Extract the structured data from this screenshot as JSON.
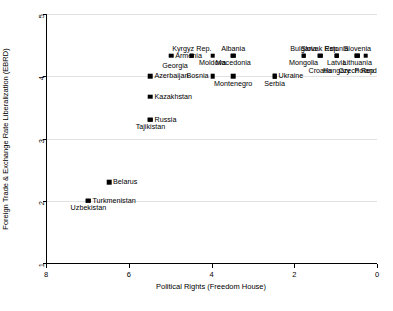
{
  "chart_data": {
    "type": "scatter",
    "title": "",
    "xlabel": "Political Rights (Freedom House)",
    "ylabel": "Foreign Trade & Exchange Rate Liberalization (EBRD)",
    "xlim": [
      8,
      0
    ],
    "ylim": [
      1,
      5
    ],
    "x_ticks": [
      8,
      6,
      4,
      2,
      0
    ],
    "y_ticks": [
      1,
      2,
      3,
      4,
      5
    ],
    "x_tick_labels": [
      "8",
      "6",
      "4",
      "2",
      "0"
    ],
    "y_tick_labels": [
      "1",
      "2",
      "3",
      "4",
      "5"
    ],
    "x_axis_reversed": true,
    "grid": "horizontal",
    "legend": "none",
    "marker": "filled-square",
    "marker_color": "#000000",
    "background_color": "#ffffff",
    "points": [
      {
        "label": "Armenia",
        "x": 5.0,
        "y": 4.33,
        "label_pos": "right"
      },
      {
        "label": "Kyrgyz Rep.",
        "x": 4.5,
        "y": 4.33,
        "label_pos": "above"
      },
      {
        "label": "Georgia",
        "x": 4.5,
        "y": 4.33,
        "label_pos": "below-left"
      },
      {
        "label": "Moldova",
        "x": 4.0,
        "y": 4.33,
        "label_pos": "below"
      },
      {
        "label": "Albania",
        "x": 3.5,
        "y": 4.33,
        "label_pos": "above"
      },
      {
        "label": "Macedonia",
        "x": 3.5,
        "y": 4.33,
        "label_pos": "below"
      },
      {
        "label": "Bulgaria",
        "x": 1.8,
        "y": 4.33,
        "label_pos": "above"
      },
      {
        "label": "Mongolia",
        "x": 1.8,
        "y": 4.33,
        "label_pos": "below"
      },
      {
        "label": "Slovak Rep.",
        "x": 1.4,
        "y": 4.33,
        "label_pos": "above"
      },
      {
        "label": "Croatia",
        "x": 1.4,
        "y": 4.33,
        "label_pos": "below2"
      },
      {
        "label": "Estonia",
        "x": 1.0,
        "y": 4.33,
        "label_pos": "above"
      },
      {
        "label": "Latvia",
        "x": 1.0,
        "y": 4.33,
        "label_pos": "below"
      },
      {
        "label": "Hungary",
        "x": 1.0,
        "y": 4.33,
        "label_pos": "below2"
      },
      {
        "label": "Slovenia",
        "x": 0.5,
        "y": 4.33,
        "label_pos": "above"
      },
      {
        "label": "Lithuania",
        "x": 0.5,
        "y": 4.33,
        "label_pos": "below"
      },
      {
        "label": "Czech Rep.",
        "x": 0.5,
        "y": 4.33,
        "label_pos": "below2"
      },
      {
        "label": "Poland",
        "x": 0.3,
        "y": 4.33,
        "label_pos": "below2"
      },
      {
        "label": "Azerbaijan",
        "x": 5.5,
        "y": 4.0,
        "label_pos": "right"
      },
      {
        "label": "Bosnia",
        "x": 4.0,
        "y": 4.0,
        "label_pos": "left"
      },
      {
        "label": "Montenegro",
        "x": 3.5,
        "y": 4.0,
        "label_pos": "below"
      },
      {
        "label": "Ukraine",
        "x": 2.5,
        "y": 4.0,
        "label_pos": "right"
      },
      {
        "label": "Serbia",
        "x": 2.5,
        "y": 4.0,
        "label_pos": "below"
      },
      {
        "label": "Kazakhstan",
        "x": 5.5,
        "y": 3.67,
        "label_pos": "right"
      },
      {
        "label": "Russia",
        "x": 5.5,
        "y": 3.3,
        "label_pos": "right"
      },
      {
        "label": "Tajikistan",
        "x": 5.5,
        "y": 3.3,
        "label_pos": "below"
      },
      {
        "label": "Belarus",
        "x": 6.5,
        "y": 2.3,
        "label_pos": "right"
      },
      {
        "label": "Turkmenistan",
        "x": 7.0,
        "y": 2.0,
        "label_pos": "right"
      },
      {
        "label": "Uzbekistan",
        "x": 7.0,
        "y": 2.0,
        "label_pos": "below"
      }
    ]
  }
}
